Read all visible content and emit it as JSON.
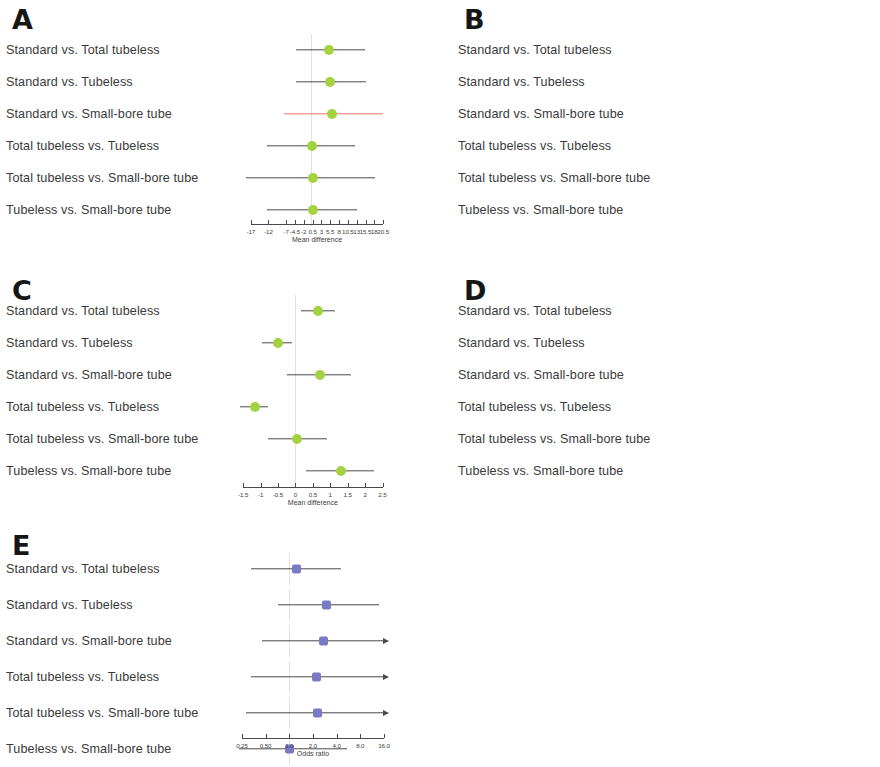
{
  "figure": {
    "comparisons": [
      "Standard vs. Total tubeless",
      "Standard vs. Tubeless",
      "Standard vs. Small-bore tube",
      "Total tubeless vs. Tubeless",
      "Total tubeless vs. Small-bore tube",
      "Tubeless vs. Small-bore tube"
    ],
    "colors": {
      "marker_green": "#a4d13f",
      "marker_purple": "#7a7ac4",
      "ci_line": "#4a4a4a",
      "ci_line_highlight": "#f0736e",
      "zero_line": "#e2e2dc",
      "text": "#3a3a3a"
    }
  },
  "chart_data": [
    {
      "panel": "A",
      "type": "forest",
      "xlabel": "Mean difference",
      "scale": "linear",
      "xlim": [
        -19.5,
        23.0
      ],
      "ticks": [
        -17,
        -12,
        -7,
        -4.5,
        -2,
        0.5,
        3,
        5.5,
        8,
        10.5,
        13,
        15.5,
        18,
        20.5
      ],
      "tick_labels": [
        "-17",
        "-12",
        "-7",
        "-4.5",
        "-2",
        "0.5",
        "3",
        "5.5",
        "8",
        "10.5",
        "13",
        "15.5",
        "18",
        "20.5"
      ],
      "null_value": 0,
      "rows": [
        {
          "label": "Standard vs. Total tubeless",
          "estimate": 5.2,
          "low": -4.3,
          "high": 15.4,
          "color": "green",
          "line": "normal"
        },
        {
          "label": "Standard vs. Tubeless",
          "estimate": 5.3,
          "low": -4.1,
          "high": 15.5,
          "color": "green",
          "line": "normal"
        },
        {
          "label": "Standard vs. Small-bore tube",
          "estimate": 6.0,
          "low": -7.5,
          "high": 20.5,
          "color": "green",
          "line": "highlight"
        },
        {
          "label": "Total tubeless vs. Tubeless",
          "estimate": 0.3,
          "low": -12.3,
          "high": 12.5,
          "color": "green",
          "line": "normal"
        },
        {
          "label": "Total tubeless vs. Small-bore tube",
          "estimate": 0.6,
          "low": -18.5,
          "high": 18.2,
          "color": "green",
          "line": "normal"
        },
        {
          "label": "Tubeless vs. Small-bore tube",
          "estimate": 0.5,
          "low": -12.4,
          "high": 13.2,
          "color": "green",
          "line": "normal"
        }
      ]
    },
    {
      "panel": "B",
      "type": "forest",
      "xlabel": "Mean difference",
      "scale": "linear",
      "xlim": [
        -5.4,
        6.3
      ],
      "ticks": [
        -5,
        -4,
        -3,
        -2,
        -1,
        0,
        1,
        2,
        3,
        4,
        5,
        6
      ],
      "tick_labels": [
        "-5",
        "-4",
        "-3",
        "-2",
        "-1",
        "0",
        "1",
        "2",
        "3",
        "4",
        "5",
        "6"
      ],
      "null_value": 0,
      "rows": [
        {
          "label": "Standard vs. Total tubeless",
          "estimate": 1.1,
          "low": -2.7,
          "high": 5.0,
          "color": "green",
          "line": "normal"
        },
        {
          "label": "Standard vs. Tubeless",
          "estimate": 1.1,
          "low": -1.0,
          "high": 3.1,
          "color": "green",
          "line": "normal"
        },
        {
          "label": "Standard vs. Small-bore tube",
          "estimate": 2.0,
          "low": -1.2,
          "high": 5.0,
          "color": "green",
          "line": "normal"
        },
        {
          "label": "Total tubeless vs. Tubeless",
          "estimate": -0.1,
          "low": -4.9,
          "high": 4.3,
          "color": "green",
          "line": "normal"
        },
        {
          "label": "Total tubeless vs. Small-bore tube",
          "estimate": 0.7,
          "low": -4.5,
          "high": 6.0,
          "color": "green",
          "line": "normal"
        },
        {
          "label": "Tubeless vs. Small-bore tube",
          "estimate": 0.7,
          "low": -1.6,
          "high": 3.2,
          "color": "green",
          "line": "normal"
        }
      ]
    },
    {
      "panel": "C",
      "type": "forest",
      "xlabel": "Mean difference",
      "scale": "linear",
      "xlim": [
        -1.65,
        2.6
      ],
      "ticks": [
        -1.5,
        -1,
        -0.5,
        0,
        0.5,
        1,
        1.5,
        2,
        2.5
      ],
      "tick_labels": [
        "-1.5",
        "-1",
        "-0.5",
        "0",
        "0.5",
        "1",
        "1.5",
        "2",
        "2.5"
      ],
      "null_value": 0,
      "rows": [
        {
          "label": "Standard vs. Total tubeless",
          "estimate": 0.65,
          "low": 0.15,
          "high": 1.15,
          "color": "green",
          "line": "normal"
        },
        {
          "label": "Standard vs. Tubeless",
          "estimate": -0.5,
          "low": -0.95,
          "high": -0.1,
          "color": "green",
          "line": "normal"
        },
        {
          "label": "Standard vs. Small-bore tube",
          "estimate": 0.7,
          "low": -0.25,
          "high": 1.6,
          "color": "green",
          "line": "normal"
        },
        {
          "label": "Total tubeless vs. Tubeless",
          "estimate": -1.15,
          "low": -1.6,
          "high": -0.8,
          "color": "green",
          "line": "normal"
        },
        {
          "label": "Total tubeless vs. Small-bore tube",
          "estimate": 0.05,
          "low": -0.8,
          "high": 0.9,
          "color": "green",
          "line": "normal"
        },
        {
          "label": "Tubeless vs. Small-bore tube",
          "estimate": 1.3,
          "low": 0.3,
          "high": 2.25,
          "color": "green",
          "line": "normal"
        }
      ]
    },
    {
      "panel": "D",
      "type": "forest",
      "xlabel": "Mean difference",
      "scale": "linear",
      "xlim": [
        -2.7,
        2.65
      ],
      "ticks": [
        -2.5,
        -2,
        -1.5,
        -1,
        -0.5,
        0,
        0.5,
        1,
        1.5,
        2,
        2.5
      ],
      "tick_labels": [
        "-2.5",
        "-2",
        "-1.5",
        "-1",
        "-0.5",
        "0",
        "0.5",
        "1",
        "1.5",
        "2",
        "2.5"
      ],
      "null_value": 0,
      "rows": [
        {
          "label": "Standard vs. Total tubeless",
          "estimate": 1.3,
          "low": 0.2,
          "high": 2.5,
          "color": "green",
          "line": "normal"
        },
        {
          "label": "Standard vs. Tubeless",
          "estimate": 1.0,
          "low": 0.2,
          "high": 1.8,
          "color": "green",
          "line": "normal"
        },
        {
          "label": "Standard vs. Small-bore tube",
          "estimate": 0.75,
          "low": -0.55,
          "high": 2.0,
          "color": "green",
          "line": "normal"
        },
        {
          "label": "Total tubeless vs. Tubeless",
          "estimate": -0.3,
          "low": -1.75,
          "high": 1.1,
          "color": "green",
          "line": "normal"
        },
        {
          "label": "Total tubeless vs. Small-bore tube",
          "estimate": -0.5,
          "low": -2.2,
          "high": 1.1,
          "color": "green",
          "line": "normal"
        },
        {
          "label": "Tubeless vs. Small-bore tube",
          "estimate": -0.3,
          "low": -1.4,
          "high": 0.85,
          "color": "green",
          "line": "normal"
        }
      ]
    },
    {
      "panel": "E",
      "type": "forest",
      "xlabel": "Odds ratio",
      "scale": "log2",
      "xlim": [
        0.21,
        18.0
      ],
      "ticks": [
        0.25,
        0.5,
        1.0,
        2.0,
        4.0,
        8.0,
        16.0
      ],
      "tick_labels": [
        "0.25",
        "0.50",
        "1.0",
        "2.0",
        "4.0",
        "8.0",
        "16.0"
      ],
      "null_value": 1.0,
      "rows": [
        {
          "label": "Standard vs. Total tubeless",
          "estimate": 1.25,
          "low": 0.33,
          "high": 4.5,
          "color": "purple",
          "line": "normal",
          "arrow_right": false
        },
        {
          "label": "Standard vs. Tubeless",
          "estimate": 3.0,
          "low": 0.72,
          "high": 14.0,
          "color": "purple",
          "line": "normal",
          "arrow_right": false
        },
        {
          "label": "Standard vs. Small-bore tube",
          "estimate": 2.7,
          "low": 0.45,
          "high": 16.0,
          "color": "purple",
          "line": "normal",
          "arrow_right": true
        },
        {
          "label": "Total tubeless vs. Tubeless",
          "estimate": 2.2,
          "low": 0.33,
          "high": 16.0,
          "color": "purple",
          "line": "normal",
          "arrow_right": true
        },
        {
          "label": "Total tubeless vs. Small-bore tube",
          "estimate": 2.3,
          "low": 0.28,
          "high": 16.0,
          "color": "purple",
          "line": "normal",
          "arrow_right": true
        },
        {
          "label": "Tubeless vs. Small-bore tube",
          "estimate": 1.0,
          "low": 0.23,
          "high": 5.5,
          "color": "purple",
          "line": "normal",
          "arrow_right": false
        }
      ]
    }
  ],
  "panels": {
    "A": {
      "letter": "A"
    },
    "B": {
      "letter": "B"
    },
    "C": {
      "letter": "C"
    },
    "D": {
      "letter": "D"
    },
    "E": {
      "letter": "E"
    }
  }
}
